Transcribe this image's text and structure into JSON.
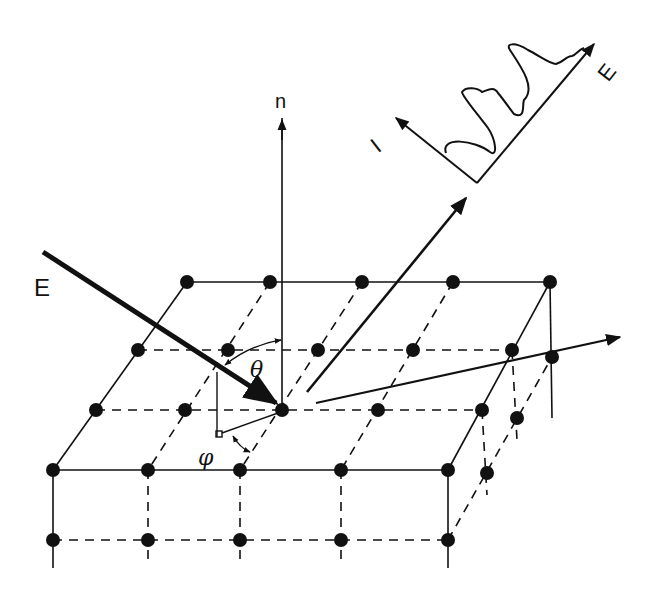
{
  "figure": {
    "type": "schematic",
    "labels": {
      "incident_beam": "E",
      "surface_normal": "n",
      "polar_angle": "θ",
      "azimuthal_angle": "φ",
      "spectrum_y_axis": "I",
      "spectrum_x_axis": "E"
    },
    "colors": {
      "ink": "#111111",
      "background": "#ffffff"
    }
  },
  "lattice": {
    "surface_rows": [
      {
        "name": "back",
        "atoms": [
          [
            187,
            282
          ],
          [
            270,
            282
          ],
          [
            362,
            282
          ],
          [
            453,
            282
          ],
          [
            550,
            282
          ]
        ]
      },
      {
        "name": "second",
        "atoms": [
          [
            138,
            350
          ],
          [
            228,
            350
          ],
          [
            318,
            350
          ],
          [
            413,
            350
          ],
          [
            512,
            350
          ]
        ]
      },
      {
        "name": "third",
        "atoms": [
          [
            96,
            410
          ],
          [
            185,
            410
          ],
          [
            282,
            410
          ],
          [
            378,
            410
          ],
          [
            482,
            410
          ]
        ]
      },
      {
        "name": "front",
        "atoms": [
          [
            53,
            470
          ],
          [
            148,
            470
          ],
          [
            240,
            470
          ],
          [
            341,
            470
          ],
          [
            448,
            470
          ]
        ]
      }
    ],
    "subsurface_front": [
      [
        53,
        540
      ],
      [
        148,
        540
      ],
      [
        240,
        540
      ],
      [
        341,
        540
      ],
      [
        448,
        540
      ]
    ],
    "subsurface_side": [
      [
        552,
        357
      ],
      [
        517,
        418
      ],
      [
        487,
        473
      ]
    ]
  }
}
